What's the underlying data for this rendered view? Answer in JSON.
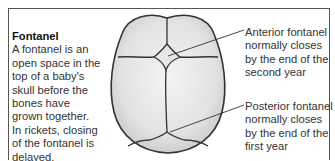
{
  "figure": {
    "heading": "Fontanel",
    "description_lines": [
      "A fontanel is an",
      "open space in the",
      "top of a baby's",
      "skull before the",
      "bones have",
      "grown together.",
      "In rickets, closing",
      "of the fontanel is",
      "delayed."
    ],
    "callouts": {
      "anterior": {
        "lines": [
          "Anterior fontanel",
          "normally closes",
          "by the end of the",
          "second year"
        ]
      },
      "posterior": {
        "lines": [
          "Posterior fontanel",
          "normally closes",
          "by the end of the",
          "first year"
        ]
      }
    }
  },
  "colors": {
    "frame": "#555555",
    "skull_outline": "#333333",
    "bone_fill": "#dcdcdc",
    "bone_highlight": "#f4f4f4",
    "text": "#333333"
  }
}
